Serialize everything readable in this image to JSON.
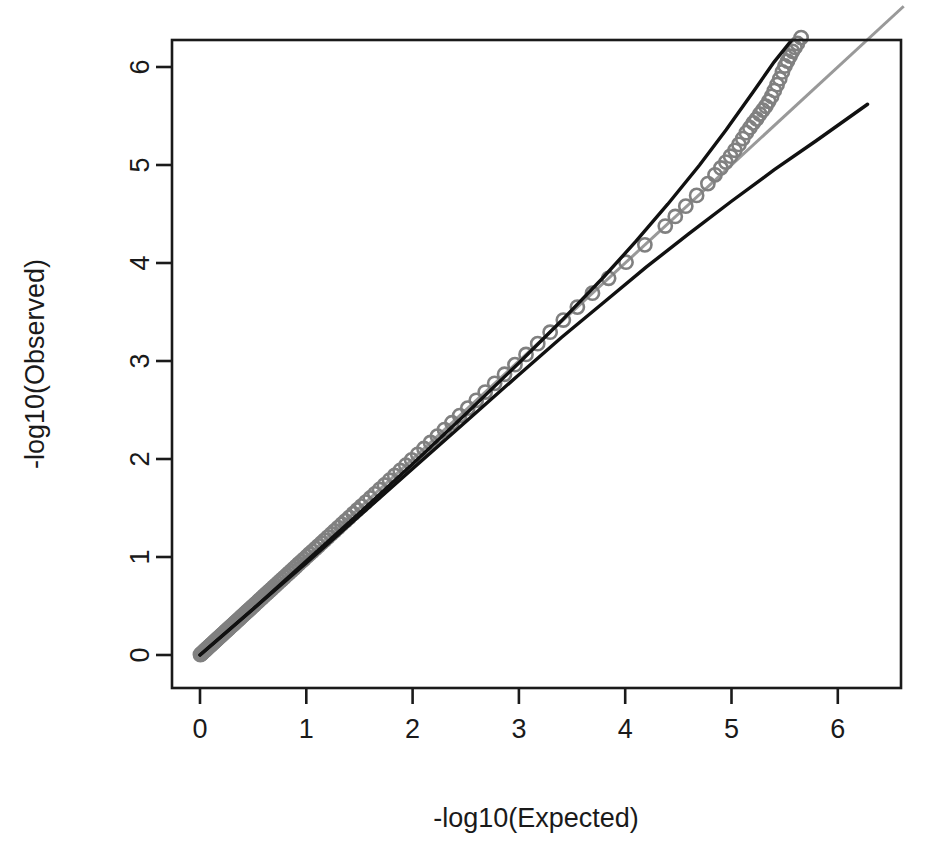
{
  "chart_data": {
    "type": "scatter",
    "title": "",
    "subtitle": "",
    "xlabel": "-log10(Expected)",
    "ylabel": "-log10(Observed)",
    "xlim": [
      -0.26,
      6.62
    ],
    "ylim": [
      -0.15,
      6.62
    ],
    "xticks": [
      0,
      1,
      2,
      3,
      4,
      5,
      6
    ],
    "yticks": [
      0,
      1,
      2,
      3,
      4,
      5,
      6
    ],
    "xtick_labels": [
      "0",
      "1",
      "2",
      "3",
      "4",
      "5",
      "6"
    ],
    "ytick_labels": [
      "0",
      "1",
      "2",
      "3",
      "4",
      "5",
      "6"
    ],
    "grid": false,
    "legend": null,
    "point_color": "#808080",
    "point_marker": "open-circle",
    "point_radius": 6.6,
    "point_stroke_width": 2.6,
    "box_color": "#1a1a1a",
    "box_stroke_width": 2.6,
    "identity_line_color": "#999999",
    "identity_line_width": 3.0,
    "curve_color": "#111111",
    "curve_width": 3.4,
    "series": [
      {
        "name": "observed-vs-expected",
        "description": "QQ scatter of observed vs expected -log10 p-values; dense band along identity from 0 to ~5.1 then discrete points deviating above",
        "x": [
          0.004,
          0.012,
          0.02,
          0.028,
          0.036,
          0.045,
          0.053,
          0.062,
          0.07,
          0.079,
          0.088,
          0.097,
          0.106,
          0.115,
          0.125,
          0.134,
          0.144,
          0.154,
          0.164,
          0.174,
          0.184,
          0.195,
          0.205,
          0.216,
          0.227,
          0.238,
          0.249,
          0.261,
          0.272,
          0.284,
          0.296,
          0.308,
          0.321,
          0.333,
          0.346,
          0.359,
          0.372,
          0.386,
          0.399,
          0.413,
          0.427,
          0.442,
          0.456,
          0.471,
          0.486,
          0.502,
          0.517,
          0.533,
          0.55,
          0.566,
          0.583,
          0.6,
          0.618,
          0.636,
          0.654,
          0.673,
          0.692,
          0.711,
          0.731,
          0.751,
          0.772,
          0.793,
          0.814,
          0.836,
          0.859,
          0.882,
          0.905,
          0.929,
          0.954,
          0.979,
          1.005,
          1.031,
          1.058,
          1.086,
          1.114,
          1.143,
          1.173,
          1.203,
          1.235,
          1.267,
          1.3,
          1.334,
          1.369,
          1.405,
          1.442,
          1.48,
          1.519,
          1.56,
          1.602,
          1.645,
          1.689,
          1.735,
          1.783,
          1.832,
          1.883,
          1.936,
          1.991,
          2.048,
          2.107,
          2.169,
          2.233,
          2.3,
          2.37,
          2.443,
          2.519,
          2.599,
          2.683,
          2.772,
          2.865,
          2.963,
          3.067,
          3.177,
          3.294,
          3.418,
          3.55,
          3.692,
          3.844,
          4.008,
          4.185,
          4.377,
          4.471,
          4.57,
          4.672,
          4.778,
          4.845,
          4.9,
          4.947,
          4.991,
          5.032,
          5.07,
          5.106,
          5.14,
          5.173,
          5.205,
          5.236,
          5.266,
          5.295,
          5.323,
          5.35,
          5.377,
          5.403,
          5.429,
          5.454,
          5.479,
          5.503,
          5.527,
          5.551,
          5.574,
          5.597,
          5.62,
          5.655,
          5.72,
          5.79,
          5.88,
          6.02,
          6.16,
          6.4
        ],
        "y": [
          0.004,
          0.012,
          0.02,
          0.028,
          0.036,
          0.045,
          0.053,
          0.062,
          0.07,
          0.079,
          0.088,
          0.097,
          0.106,
          0.115,
          0.125,
          0.134,
          0.144,
          0.154,
          0.164,
          0.174,
          0.184,
          0.195,
          0.205,
          0.216,
          0.227,
          0.238,
          0.249,
          0.261,
          0.272,
          0.284,
          0.296,
          0.308,
          0.321,
          0.333,
          0.346,
          0.359,
          0.372,
          0.386,
          0.399,
          0.413,
          0.427,
          0.442,
          0.456,
          0.471,
          0.486,
          0.502,
          0.517,
          0.533,
          0.55,
          0.566,
          0.583,
          0.6,
          0.618,
          0.636,
          0.654,
          0.673,
          0.692,
          0.711,
          0.731,
          0.751,
          0.772,
          0.793,
          0.814,
          0.836,
          0.859,
          0.882,
          0.905,
          0.929,
          0.954,
          0.979,
          1.005,
          1.031,
          1.058,
          1.086,
          1.114,
          1.143,
          1.173,
          1.203,
          1.235,
          1.267,
          1.3,
          1.334,
          1.369,
          1.405,
          1.442,
          1.48,
          1.519,
          1.56,
          1.602,
          1.645,
          1.689,
          1.735,
          1.783,
          1.832,
          1.883,
          1.936,
          1.991,
          2.048,
          2.107,
          2.169,
          2.233,
          2.3,
          2.37,
          2.443,
          2.519,
          2.599,
          2.683,
          2.772,
          2.865,
          2.963,
          3.067,
          3.177,
          3.294,
          3.418,
          3.55,
          3.692,
          3.844,
          4.008,
          4.185,
          4.377,
          4.475,
          4.58,
          4.69,
          4.81,
          4.9,
          4.97,
          5.03,
          5.09,
          5.15,
          5.21,
          5.27,
          5.33,
          5.38,
          5.43,
          5.47,
          5.52,
          5.56,
          5.6,
          5.65,
          5.7,
          5.76,
          5.82,
          5.88,
          5.95,
          6.01,
          6.06,
          6.11,
          6.16,
          6.2,
          6.24,
          6.3,
          6.36,
          6.4,
          6.44,
          6.47,
          6.49,
          6.5
        ]
      }
    ],
    "reference_lines": [
      {
        "name": "identity-line",
        "type": "line",
        "color": "#999999",
        "description": "y = x identity reference line",
        "x": [
          0,
          6.62
        ],
        "y": [
          0,
          6.62
        ]
      },
      {
        "name": "upper-confidence-curve",
        "type": "curve",
        "color": "#111111",
        "description": "steep black curve rising above identity at high quantiles, exits top of panel near x=5.97",
        "x": [
          0.0,
          0.5,
          1.0,
          1.5,
          2.0,
          2.5,
          3.0,
          3.4,
          3.8,
          4.1,
          4.4,
          4.7,
          4.95,
          5.2,
          5.4,
          5.6,
          5.78,
          5.9,
          5.97
        ],
        "y": [
          0.0,
          0.47,
          0.96,
          1.45,
          1.95,
          2.46,
          2.98,
          3.41,
          3.86,
          4.22,
          4.6,
          5.0,
          5.36,
          5.74,
          6.05,
          6.32,
          6.5,
          6.58,
          6.62
        ]
      },
      {
        "name": "lower-confidence-curve",
        "type": "curve",
        "color": "#111111",
        "description": "flatter black curve falling below identity at high quantiles, terminates near x=6.28",
        "x": [
          0.0,
          0.5,
          1.0,
          1.5,
          2.0,
          2.5,
          3.0,
          3.4,
          3.8,
          4.2,
          4.6,
          5.0,
          5.4,
          5.8,
          6.28
        ],
        "y": [
          0.0,
          0.47,
          0.94,
          1.42,
          1.9,
          2.38,
          2.86,
          3.24,
          3.6,
          3.96,
          4.3,
          4.63,
          4.95,
          5.25,
          5.62
        ]
      }
    ]
  },
  "axes": {
    "x_title": "-log10(Expected)",
    "y_title": "-log10(Observed)"
  }
}
